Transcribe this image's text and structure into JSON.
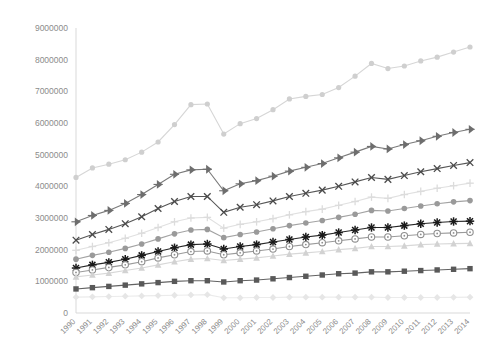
{
  "chart_data": {
    "type": "line",
    "title": "",
    "subtitle": "",
    "xlabel": "",
    "ylabel": "",
    "grid": false,
    "legend_position": "none",
    "ylim": [
      0,
      9000000
    ],
    "yticks": [
      0,
      1000000,
      2000000,
      3000000,
      4000000,
      5000000,
      6000000,
      7000000,
      8000000,
      9000000
    ],
    "ytick_labels": [
      "0",
      "1000000",
      "2000000",
      "3000000",
      "4000000",
      "5000000",
      "6000000",
      "7000000",
      "8000000",
      "9000000"
    ],
    "categories": [
      "1990",
      "1991",
      "1992",
      "1993",
      "1994",
      "1995",
      "1996",
      "1997",
      "1998",
      "1999",
      "2000",
      "2001",
      "2002",
      "2003",
      "2004",
      "2005",
      "2006",
      "2007",
      "2008",
      "2009",
      "2010",
      "2011",
      "2012",
      "2013",
      "2014"
    ],
    "x": [
      1990,
      1991,
      1992,
      1993,
      1994,
      1995,
      1996,
      1997,
      1998,
      1999,
      2000,
      2001,
      2002,
      2003,
      2004,
      2005,
      2006,
      2007,
      2008,
      2009,
      2010,
      2011,
      2012,
      2013,
      2014
    ],
    "series": [
      {
        "name": "Series 1",
        "marker": "circle",
        "color": "#cfcfcf",
        "line_color": "#d6d6d6",
        "values": [
          4280000,
          4580000,
          4700000,
          4840000,
          5080000,
          5400000,
          5950000,
          6580000,
          6600000,
          5650000,
          5980000,
          6140000,
          6420000,
          6760000,
          6840000,
          6900000,
          7120000,
          7480000,
          7880000,
          7720000,
          7800000,
          7960000,
          8080000,
          8240000,
          8400000
        ]
      },
      {
        "name": "Series 2",
        "marker": "triangle-right",
        "color": "#6e6e6e",
        "line_color": "#7a7a7a",
        "values": [
          2880000,
          3080000,
          3240000,
          3460000,
          3740000,
          4060000,
          4380000,
          4520000,
          4540000,
          3860000,
          4080000,
          4180000,
          4320000,
          4480000,
          4600000,
          4720000,
          4900000,
          5080000,
          5260000,
          5180000,
          5320000,
          5440000,
          5580000,
          5700000,
          5800000
        ]
      },
      {
        "name": "Series 3",
        "marker": "x",
        "color": "#4a4a4a",
        "line_color": "#565656",
        "values": [
          2300000,
          2480000,
          2640000,
          2820000,
          3040000,
          3300000,
          3520000,
          3680000,
          3680000,
          3180000,
          3340000,
          3420000,
          3540000,
          3680000,
          3780000,
          3880000,
          4000000,
          4140000,
          4280000,
          4220000,
          4340000,
          4460000,
          4560000,
          4660000,
          4750000
        ]
      },
      {
        "name": "Series 4",
        "marker": "plus",
        "color": "#dcdcdc",
        "line_color": "#e0e0e0",
        "values": [
          1980000,
          2100000,
          2220000,
          2360000,
          2520000,
          2700000,
          2880000,
          3000000,
          3020000,
          2680000,
          2800000,
          2880000,
          2980000,
          3100000,
          3200000,
          3280000,
          3400000,
          3520000,
          3660000,
          3620000,
          3740000,
          3840000,
          3940000,
          4020000,
          4100000
        ]
      },
      {
        "name": "Series 5",
        "marker": "circle-filled",
        "color": "#9a9a9a",
        "line_color": "#a3a3a3",
        "values": [
          1700000,
          1820000,
          1920000,
          2040000,
          2180000,
          2340000,
          2500000,
          2620000,
          2640000,
          2380000,
          2480000,
          2560000,
          2660000,
          2760000,
          2840000,
          2920000,
          3020000,
          3120000,
          3240000,
          3220000,
          3300000,
          3380000,
          3450000,
          3510000,
          3550000
        ]
      },
      {
        "name": "Series 6",
        "marker": "star",
        "color": "#1a1a1a",
        "line_color": "#262626",
        "values": [
          1420000,
          1520000,
          1600000,
          1700000,
          1820000,
          1940000,
          2060000,
          2160000,
          2180000,
          2020000,
          2100000,
          2160000,
          2240000,
          2320000,
          2400000,
          2460000,
          2540000,
          2620000,
          2700000,
          2700000,
          2760000,
          2820000,
          2860000,
          2890000,
          2900000
        ]
      },
      {
        "name": "Series 7",
        "marker": "circle-open",
        "color": "#8f8f8f",
        "line_color": "#9a9a9a",
        "values": [
          1280000,
          1360000,
          1440000,
          1520000,
          1620000,
          1740000,
          1840000,
          1940000,
          1960000,
          1840000,
          1900000,
          1960000,
          2020000,
          2100000,
          2160000,
          2220000,
          2280000,
          2340000,
          2400000,
          2400000,
          2440000,
          2480000,
          2510000,
          2530000,
          2550000
        ]
      },
      {
        "name": "Series 8",
        "marker": "triangle-up",
        "color": "#d2d2d2",
        "line_color": "#d8d8d8",
        "values": [
          1140000,
          1200000,
          1260000,
          1340000,
          1420000,
          1520000,
          1620000,
          1700000,
          1720000,
          1660000,
          1700000,
          1740000,
          1800000,
          1860000,
          1900000,
          1940000,
          2000000,
          2040000,
          2100000,
          2100000,
          2120000,
          2160000,
          2180000,
          2190000,
          2200000
        ]
      },
      {
        "name": "Series 9",
        "marker": "square",
        "color": "#595959",
        "line_color": "#636363",
        "values": [
          760000,
          800000,
          840000,
          880000,
          920000,
          960000,
          1000000,
          1020000,
          1020000,
          980000,
          1020000,
          1040000,
          1080000,
          1120000,
          1160000,
          1200000,
          1240000,
          1260000,
          1300000,
          1300000,
          1320000,
          1340000,
          1360000,
          1380000,
          1400000
        ]
      },
      {
        "name": "Series 10",
        "marker": "diamond",
        "color": "#e6e6e6",
        "line_color": "#ebebeb",
        "values": [
          500000,
          510000,
          520000,
          530000,
          540000,
          550000,
          560000,
          570000,
          580000,
          480000,
          480000,
          490000,
          490000,
          500000,
          500000,
          500000,
          500000,
          500000,
          500000,
          490000,
          490000,
          490000,
          490000,
          495000,
          500000
        ]
      }
    ]
  },
  "axes": {
    "y_axis_name": "value-axis",
    "x_axis_name": "year-axis",
    "tick_color": "#8c8c8c",
    "axis_color": "#d9d9d9"
  }
}
